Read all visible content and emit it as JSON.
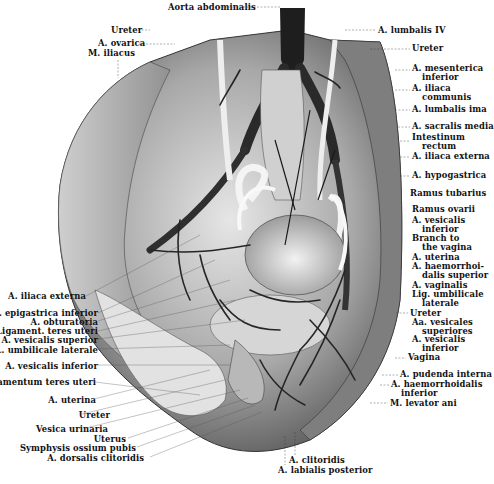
{
  "figure": {
    "type": "anatomical illustration",
    "palette": {
      "paper": "#ffffff",
      "ink": "#111111",
      "tissue_light": "#d8d8d8",
      "tissue_mid": "#9a9a9a",
      "vessel_dark": "#222222"
    }
  },
  "labels_top": [
    {
      "id": "aorta",
      "text": "Aorta abdominalis",
      "x": 168,
      "y": 3
    },
    {
      "id": "ureter-top-left",
      "text": "Ureter",
      "x": 151,
      "y": 26
    },
    {
      "id": "ovarica",
      "text": "A. ovarica",
      "x": 101,
      "y": 41
    },
    {
      "id": "iliacus",
      "text": "M. iliacus",
      "x": 88,
      "y": 50
    },
    {
      "id": "lumbalis-iv",
      "text": "A. lumbalis IV",
      "x": 378,
      "y": 27
    }
  ],
  "labels_right": [
    {
      "id": "ureter-r1",
      "text": "Ureter",
      "sub": "",
      "x": 412,
      "y": 46
    },
    {
      "id": "mesenterica",
      "text": "A. mesenterica",
      "sub": "inferior",
      "x": 412,
      "y": 66
    },
    {
      "id": "iliaca-communis",
      "text": "A. iliaca",
      "sub": "communis",
      "x": 412,
      "y": 87
    },
    {
      "id": "lumbalis-ima",
      "text": "A. lumbalis ima",
      "sub": "",
      "x": 412,
      "y": 107
    },
    {
      "id": "sacralis-media",
      "text": "A. sacralis media",
      "sub": "",
      "x": 412,
      "y": 124
    },
    {
      "id": "intestinum",
      "text": "Intestinum",
      "sub": "rectum",
      "x": 412,
      "y": 135
    },
    {
      "id": "iliaca-externa-r",
      "text": "A. iliaca externa",
      "sub": "",
      "x": 412,
      "y": 154
    },
    {
      "id": "hypogastrica",
      "text": "A. hypogastrica",
      "sub": "",
      "x": 412,
      "y": 173
    },
    {
      "id": "ramus-tubarius",
      "text": "Ramus tubarius",
      "sub": "",
      "x": 410,
      "y": 191
    },
    {
      "id": "ramus-ovarii",
      "text": "Ramus ovarii",
      "sub": "",
      "x": 412,
      "y": 206
    },
    {
      "id": "vesicalis-inferior-r1",
      "text": "A. vesicalis",
      "sub": "inferior",
      "x": 412,
      "y": 218
    },
    {
      "id": "branch-vagina",
      "text": "Branch to",
      "sub": "the vagina",
      "x": 412,
      "y": 236
    },
    {
      "id": "uterina-r",
      "text": "A. uterina",
      "sub": "",
      "x": 412,
      "y": 254
    },
    {
      "id": "haemorrhoidalis-sup",
      "text": "A. haemorrhoi-",
      "sub": "dalis superior",
      "x": 412,
      "y": 263
    },
    {
      "id": "vaginalis",
      "text": "A. vaginalis",
      "sub": "",
      "x": 412,
      "y": 282
    },
    {
      "id": "lig-umbilicale-r",
      "text": "Lig. umbilicale",
      "sub": "laterale",
      "x": 412,
      "y": 292
    },
    {
      "id": "ureter-r2",
      "text": "Ureter",
      "sub": "",
      "x": 410,
      "y": 310
    },
    {
      "id": "vesicales-sup",
      "text": "Aa. vesicales",
      "sub": "superiores",
      "x": 412,
      "y": 320
    },
    {
      "id": "vesicalis-inferior-r2",
      "text": "A. vesicalis",
      "sub": "inferior",
      "x": 412,
      "y": 337
    },
    {
      "id": "vagina",
      "text": "Vagina",
      "sub": "",
      "x": 408,
      "y": 355
    },
    {
      "id": "pudenda",
      "text": "A. pudenda interna",
      "sub": "",
      "x": 400,
      "y": 372
    },
    {
      "id": "haemorrhoidalis-inf",
      "text": "A. haemorrhoidalis",
      "sub": "inferior",
      "x": 391,
      "y": 382
    },
    {
      "id": "levator-ani",
      "text": "M. levator ani",
      "sub": "",
      "x": 390,
      "y": 400
    }
  ],
  "labels_left": [
    {
      "id": "iliaca-externa-l",
      "text": "A. iliaca externa",
      "right": 412,
      "y": 296,
      "bold": true
    },
    {
      "id": "epigastrica",
      "text": "A. epigastrica inferior",
      "right": 398,
      "y": 312
    },
    {
      "id": "obturatoria",
      "text": "A. obturatoria",
      "right": 398,
      "y": 320
    },
    {
      "id": "teres-uteri",
      "text": "Ligament. teres uteri",
      "right": 398,
      "y": 330
    },
    {
      "id": "vesicalis-superior",
      "text": "A. vesicalis superior",
      "right": 398,
      "y": 338
    },
    {
      "id": "umbilicale-l",
      "text": "L. umbilicale laterale",
      "right": 398,
      "y": 348
    },
    {
      "id": "vesicalis-inferior-l",
      "text": "A. vesicalis inferior",
      "right": 398,
      "y": 364
    },
    {
      "id": "ligamentum-teres",
      "text": "Ligamentum teres uteri",
      "right": 395,
      "y": 381,
      "bold": true
    },
    {
      "id": "uterina-l",
      "text": "A. uterina",
      "right": 394,
      "y": 398
    },
    {
      "id": "ureter-l",
      "text": "Ureter",
      "right": 382,
      "y": 413
    },
    {
      "id": "vesica",
      "text": "Vesica urinaria",
      "right": 386,
      "y": 427
    },
    {
      "id": "uterus",
      "text": "Uterus",
      "right": 368,
      "y": 437
    },
    {
      "id": "symphysis",
      "text": "Symphysis ossium pubis",
      "right": 357,
      "y": 446
    },
    {
      "id": "dorsalis",
      "text": "A. dorsalis clitoridis",
      "right": 348,
      "y": 456
    }
  ],
  "labels_bottom": [
    {
      "id": "clitoridis",
      "text": "A. clitoridis",
      "x": 289,
      "y": 456
    },
    {
      "id": "labialis",
      "text": "A. labialis posterior",
      "x": 277,
      "y": 466
    }
  ]
}
